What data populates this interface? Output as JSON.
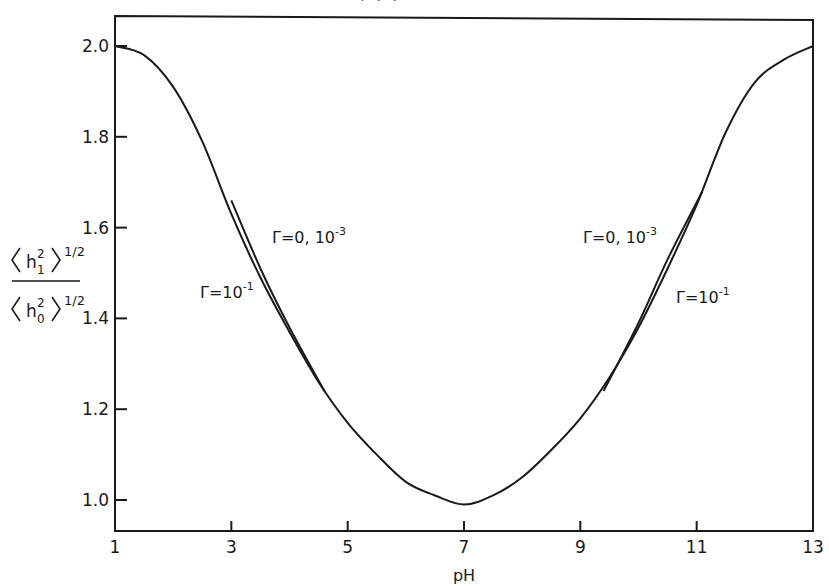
{
  "chart_data": {
    "type": "line",
    "title": "",
    "xlabel": "pH",
    "ylabel": "⟨h₁²⟩^½ / ⟨h₀²⟩^½",
    "ylabel_parts": {
      "numerator": "h",
      "numerator_sup": "2",
      "numerator_sub": "1",
      "denominator": "h",
      "denominator_sup": "2",
      "denominator_sub": "0",
      "exponent": "1/2"
    },
    "xlim": [
      1,
      13
    ],
    "ylim": [
      0.93,
      2.07
    ],
    "x_ticks": [
      1,
      3,
      5,
      7,
      9,
      11,
      13
    ],
    "x_tick_labels": [
      "1",
      "3",
      "5",
      "7",
      "9",
      "11",
      "13"
    ],
    "y_ticks": [
      1.0,
      1.2,
      1.4,
      1.6,
      1.8,
      2.0
    ],
    "y_tick_labels": [
      "1.0",
      "1.2",
      "1.4",
      "1.6",
      "1.8",
      "2.0"
    ],
    "grid": false,
    "legend": null,
    "series": [
      {
        "name": "Γ=10⁻¹",
        "x": [
          1,
          1.5,
          2,
          2.5,
          3,
          3.5,
          4,
          4.5,
          5,
          5.5,
          6,
          6.5,
          7,
          7.5,
          8,
          8.5,
          9,
          9.5,
          10,
          10.5,
          11,
          11.5,
          12,
          12.5,
          13
        ],
        "values": [
          2.0,
          1.98,
          1.91,
          1.79,
          1.63,
          1.49,
          1.37,
          1.26,
          1.17,
          1.1,
          1.04,
          1.01,
          0.99,
          1.01,
          1.05,
          1.11,
          1.18,
          1.27,
          1.38,
          1.51,
          1.65,
          1.81,
          1.92,
          1.97,
          2.0
        ]
      },
      {
        "name": "Γ=0, 10⁻³ (low pH branch)",
        "x": [
          3.0,
          3.5,
          4.0,
          4.6
        ],
        "values": [
          1.66,
          1.51,
          1.38,
          1.24
        ]
      },
      {
        "name": "Γ=0, 10⁻³ (high pH branch)",
        "x": [
          9.4,
          10.0,
          10.5,
          11.1
        ],
        "values": [
          1.24,
          1.39,
          1.53,
          1.68
        ]
      }
    ],
    "annotations": [
      {
        "text": "Γ=0, 10",
        "sup": "-3",
        "x": 3.4,
        "y": 1.55
      },
      {
        "text": "Γ=10",
        "sup": "-1",
        "x": 2.3,
        "y": 1.42
      },
      {
        "text": "Γ=0, 10",
        "sup": "-3",
        "x": 8.5,
        "y": 1.55
      },
      {
        "text": "Γ=10",
        "sup": "-1",
        "x": 11.2,
        "y": 1.42
      }
    ]
  },
  "page": {
    "cut_text": "· · ·"
  }
}
